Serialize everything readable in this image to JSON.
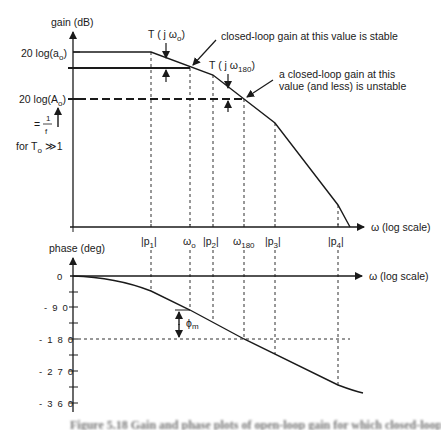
{
  "gain_plot": {
    "y_axis_label": "gain  (dB)",
    "x_axis_label": "ω (log scale)",
    "level_labels": {
      "open_loop_dc": "20  log(a",
      "open_loop_dc_sub": "o",
      "closed_loop": "20  log(A",
      "closed_loop_sub": "o",
      "equals_prefix": "=",
      "frac_num": "1",
      "frac_den": "f",
      "condition": "for  T",
      "condition_sub": "o",
      "condition_tail": " ≫1"
    },
    "annotations": {
      "t_w0": "T ( j ω",
      "t_w0_sub": "o",
      "t_w180": "T ( j ω",
      "t_w180_sub": "180",
      "stable_note": "closed-loop gain at this value is stable",
      "unstable_note_line1": "a closed-loop gain at this",
      "unstable_note_line2": "value (and less) is unstable"
    }
  },
  "frequency_markers": [
    {
      "label": "|p",
      "sub": "1",
      "tail": "|"
    },
    {
      "label": "ω",
      "sub": "o",
      "tail": ""
    },
    {
      "label": "|p",
      "sub": "2",
      "tail": "|"
    },
    {
      "label": "ω",
      "sub": "180",
      "tail": ""
    },
    {
      "label": "|p",
      "sub": "3",
      "tail": "|"
    },
    {
      "label": "|p",
      "sub": "4",
      "tail": "|"
    }
  ],
  "phase_plot": {
    "y_axis_label": "phase  (deg)",
    "x_axis_label": "ω (log scale)",
    "tick_labels": [
      "0",
      "- 9 0",
      "- 1 8 0",
      "- 2 7 0",
      "- 3 6 0"
    ],
    "margin_label": "ϕ",
    "margin_sub": "m"
  },
  "caption": "Figure 5.18  Gain and phase plots of open-loop gain for which closed-loop gain differs"
}
